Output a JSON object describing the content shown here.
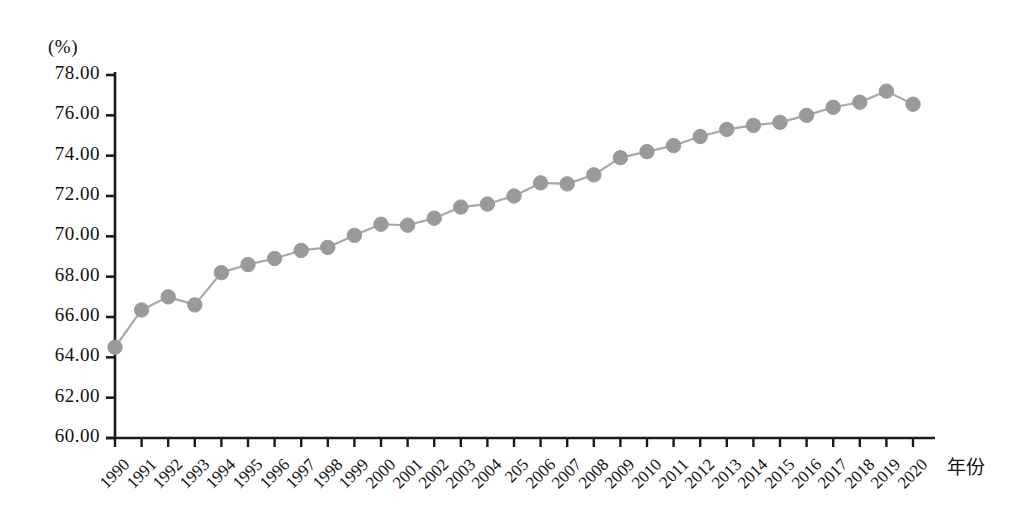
{
  "chart_data": {
    "type": "line",
    "title": "",
    "subtitle": "",
    "xlabel": "年份",
    "ylabel": "",
    "yunit": "(%)",
    "ylim": [
      60.0,
      78.0
    ],
    "yticks": [
      "60.00",
      "62.00",
      "64.00",
      "66.00",
      "68.00",
      "70.00",
      "72.00",
      "74.00",
      "76.00",
      "78.00"
    ],
    "grid": false,
    "legend": null,
    "marker": "circle",
    "series_color": "#9a9a9a",
    "line_color": "#a8a8a8",
    "axis_color": "#1a1a1a",
    "categories": [
      "1990",
      "1991",
      "1992",
      "1993",
      "1994",
      "1995",
      "1996",
      "1997",
      "1998",
      "1999",
      "2000",
      "2001",
      "2002",
      "2003",
      "2004",
      "205",
      "2006",
      "2007",
      "2008",
      "2009",
      "2010",
      "2011",
      "2012",
      "2013",
      "2014",
      "2015",
      "2016",
      "2017",
      "2018",
      "2019",
      "2020"
    ],
    "values": [
      64.5,
      66.35,
      67.0,
      66.6,
      68.2,
      68.6,
      68.9,
      69.3,
      69.45,
      70.05,
      70.6,
      70.55,
      70.9,
      71.45,
      71.6,
      72.0,
      72.65,
      72.6,
      73.05,
      73.9,
      74.2,
      74.5,
      74.95,
      75.3,
      75.5,
      75.65,
      76.0,
      76.4,
      76.65,
      77.2,
      76.55
    ],
    "series": [
      {
        "name": "",
        "values": [
          64.5,
          66.35,
          67.0,
          66.6,
          68.2,
          68.6,
          68.9,
          69.3,
          69.45,
          70.05,
          70.6,
          70.55,
          70.9,
          71.45,
          71.6,
          72.0,
          72.65,
          72.6,
          73.05,
          73.9,
          74.2,
          74.5,
          74.95,
          75.3,
          75.5,
          75.65,
          76.0,
          76.4,
          76.65,
          77.2,
          76.55
        ]
      }
    ]
  }
}
